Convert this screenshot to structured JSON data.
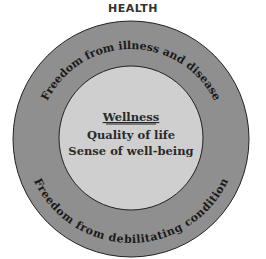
{
  "title": "HEALTH",
  "outer_ring": {
    "top_text": "Freedom from illness and disease",
    "bottom_text": "Freedom from debilitating condition",
    "fill": "#8f8f8f"
  },
  "inner_circle": {
    "heading": "Wellness",
    "line1": "Quality of life",
    "line2": "Sense of well-being",
    "fill": "#cfcfcf"
  }
}
